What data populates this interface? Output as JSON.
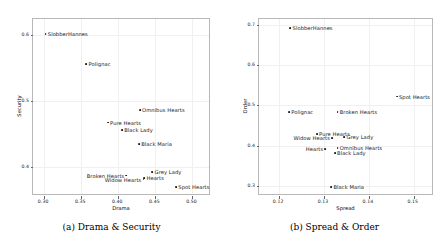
{
  "figure": {
    "subfigures": [
      {
        "key": "a",
        "caption": "(a) Drama & Security",
        "chart_data": {
          "type": "scatter",
          "title": "",
          "xlabel": "Drama",
          "ylabel": "Security",
          "xlim": [
            0.285,
            0.525
          ],
          "ylim": [
            0.355,
            0.625
          ],
          "xticks": [
            0.3,
            0.35,
            0.4,
            0.45,
            0.5
          ],
          "xticklabels": [
            "0.30",
            "0.35",
            "0.40",
            "0.45",
            "0.50"
          ],
          "yticks": [
            0.4,
            0.5,
            0.6
          ],
          "yticklabels": [
            "0.4",
            "0.5",
            "0.6"
          ],
          "grid": true,
          "legend": "none",
          "points": [
            {
              "label": "SlobberHannes",
              "x": 0.302,
              "y": 0.602,
              "label_side": "right"
            },
            {
              "label": "Polignac",
              "x": 0.357,
              "y": 0.556,
              "label_side": "right"
            },
            {
              "label": "Omnibus Hearts",
              "x": 0.429,
              "y": 0.486,
              "label_side": "right"
            },
            {
              "label": "Pure Hearts",
              "x": 0.386,
              "y": 0.467,
              "label_side": "right"
            },
            {
              "label": "Black Lady",
              "x": 0.405,
              "y": 0.456,
              "label_side": "right"
            },
            {
              "label": "Black Maria",
              "x": 0.428,
              "y": 0.434,
              "label_side": "right"
            },
            {
              "label": "Grey Lady",
              "x": 0.446,
              "y": 0.392,
              "label_side": "right"
            },
            {
              "label": "Broken Hearts",
              "x": 0.411,
              "y": 0.386,
              "label_side": "left"
            },
            {
              "label": "Hearts",
              "x": 0.435,
              "y": 0.382,
              "label_side": "right"
            },
            {
              "label": "Widow Hearts",
              "x": 0.434,
              "y": 0.38,
              "label_side": "left"
            },
            {
              "label": "Spot Hearts",
              "x": 0.478,
              "y": 0.368,
              "label_side": "right"
            }
          ]
        }
      },
      {
        "key": "b",
        "caption": "(b) Spread & Order",
        "chart_data": {
          "type": "scatter",
          "title": "",
          "xlabel": "Spread",
          "ylabel": "Order",
          "xlim": [
            0.1155,
            0.1545
          ],
          "ylim": [
            0.275,
            0.715
          ],
          "xticks": [
            0.12,
            0.13,
            0.14,
            0.15
          ],
          "xticklabels": [
            "0.12",
            "0.13",
            "0.14",
            "0.15"
          ],
          "yticks": [
            0.3,
            0.4,
            0.5,
            0.6,
            0.7
          ],
          "yticklabels": [
            "0.3",
            "0.4",
            "0.5",
            "0.6",
            "0.7"
          ],
          "grid": true,
          "legend": "none",
          "points": [
            {
              "label": "SlobberHannes",
              "x": 0.1225,
              "y": 0.692,
              "label_side": "right"
            },
            {
              "label": "Spot Hearts",
              "x": 0.1462,
              "y": 0.522,
              "label_side": "right"
            },
            {
              "label": "Polignac",
              "x": 0.1222,
              "y": 0.484,
              "label_side": "right"
            },
            {
              "label": "Broken Hearts",
              "x": 0.133,
              "y": 0.483,
              "label_side": "right"
            },
            {
              "label": "Pure Hearts",
              "x": 0.1284,
              "y": 0.428,
              "label_side": "right"
            },
            {
              "label": "Grey Lady",
              "x": 0.1345,
              "y": 0.422,
              "label_side": "right"
            },
            {
              "label": "Widow Hearts",
              "x": 0.1318,
              "y": 0.419,
              "label_side": "left"
            },
            {
              "label": "Omnibus Hearts",
              "x": 0.133,
              "y": 0.395,
              "label_side": "right"
            },
            {
              "label": "Hearts",
              "x": 0.1303,
              "y": 0.392,
              "label_side": "left"
            },
            {
              "label": "Black Lady",
              "x": 0.1324,
              "y": 0.381,
              "label_side": "right"
            },
            {
              "label": "Black Maria",
              "x": 0.1316,
              "y": 0.298,
              "label_side": "right"
            }
          ]
        }
      }
    ]
  }
}
